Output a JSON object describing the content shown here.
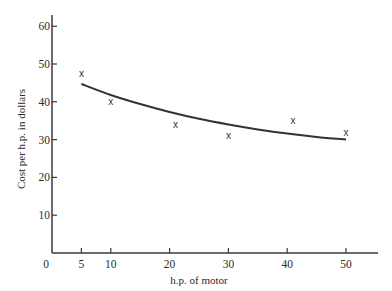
{
  "chart_data": {
    "type": "scatter",
    "title": "",
    "xlabel": "h.p. of motor",
    "ylabel": "Cost per h.p. in dollars",
    "xlim": [
      0,
      55
    ],
    "ylim": [
      0,
      63
    ],
    "grid": false,
    "legend": null,
    "x_ticks": [
      0,
      5,
      10,
      20,
      30,
      40,
      50
    ],
    "y_ticks": [
      10,
      20,
      30,
      40,
      50,
      60
    ],
    "series": [
      {
        "name": "observed",
        "marker": "x",
        "points": [
          {
            "x": 5,
            "y": 47.5
          },
          {
            "x": 10,
            "y": 40
          },
          {
            "x": 21,
            "y": 34
          },
          {
            "x": 30,
            "y": 31
          },
          {
            "x": 41,
            "y": 35
          },
          {
            "x": 50,
            "y": 32
          }
        ]
      },
      {
        "name": "fitted curve",
        "type": "line",
        "points": [
          {
            "x": 5,
            "y": 44.7
          },
          {
            "x": 10,
            "y": 41.8
          },
          {
            "x": 15,
            "y": 39.4
          },
          {
            "x": 20,
            "y": 37.3
          },
          {
            "x": 25,
            "y": 35.5
          },
          {
            "x": 30,
            "y": 34.0
          },
          {
            "x": 35,
            "y": 32.7
          },
          {
            "x": 40,
            "y": 31.6
          },
          {
            "x": 45,
            "y": 30.7
          },
          {
            "x": 50,
            "y": 30.0
          }
        ]
      }
    ]
  }
}
